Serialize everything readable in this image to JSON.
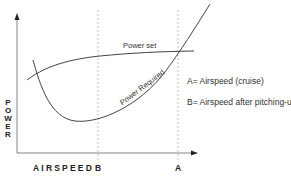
{
  "diagram": {
    "y_axis_label_letters": [
      "P",
      "O",
      "W",
      "E",
      "R"
    ],
    "x_axis_label": "AIRSPEED",
    "markers": [
      {
        "id": "B",
        "label": "B"
      },
      {
        "id": "A",
        "label": "A"
      }
    ],
    "curves": {
      "power_set": "Power set",
      "power_required": "Power Required"
    },
    "legend": {
      "a": "A= Airspeed (cruise)",
      "b": "B= Airspeed after pitching-up"
    },
    "colors": {
      "line": "#444444",
      "dashed": "#aaaaaa",
      "axis": "#555555"
    }
  }
}
